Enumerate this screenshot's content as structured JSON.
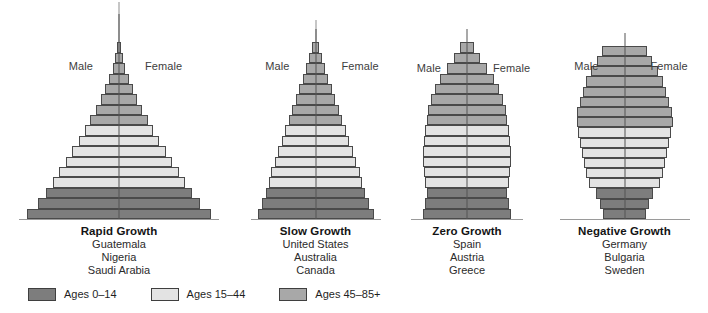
{
  "figure": {
    "type": "population-pyramid-set",
    "background": "#ffffff"
  },
  "colors": {
    "age_0_14": "#7d7d7d",
    "age_15_44": "#e3e3e3",
    "age_45_85plus": "#a8a8a8",
    "outline": "#4a4a4a",
    "centerline": "#555555",
    "baseline": "#9a9a9a",
    "text": "#1a1a1a"
  },
  "legend": {
    "items": [
      {
        "label": "Ages 0–14",
        "color_key": "age_0_14",
        "color": "#7d7d7d"
      },
      {
        "label": "Ages 15–44",
        "color_key": "age_15_44",
        "color": "#e3e3e3"
      },
      {
        "label": "Ages 45–85+",
        "color_key": "age_45_85plus",
        "color": "#a8a8a8"
      }
    ]
  },
  "sex_labels": {
    "male": "Male",
    "female": "Female"
  },
  "chart_data": {
    "type": "bar",
    "title": "",
    "subtitle": "",
    "xlabel": "",
    "ylabel": "",
    "legend_position": "bottom-left",
    "grid": false,
    "age_bands": [
      "Ages 0–14",
      "Ages 15–44",
      "Ages 45–85+"
    ],
    "band_row_counts": {
      "age_0_14": 3,
      "age_15_44": 6,
      "age_45_85plus": 8
    },
    "panels": [
      {
        "title": "Rapid Growth",
        "countries": [
          "Guatemala",
          "Nigeria",
          "Saudi Arabia"
        ],
        "shape": "broad-based triangle",
        "bars_bottom_to_top": [
          100,
          88,
          79,
          72,
          65,
          58,
          51,
          44,
          37,
          31,
          25,
          20,
          15,
          11,
          7,
          4,
          2
        ],
        "bar_bands": [
          "age_0_14",
          "age_0_14",
          "age_0_14",
          "age_15_44",
          "age_15_44",
          "age_15_44",
          "age_15_44",
          "age_15_44",
          "age_15_44",
          "age_45_85plus",
          "age_45_85plus",
          "age_45_85plus",
          "age_45_85plus",
          "age_45_85plus",
          "age_45_85plus",
          "age_45_85plus",
          "age_45_85plus"
        ]
      },
      {
        "title": "Slow Growth",
        "countries": [
          "United States",
          "Australia",
          "Canada"
        ],
        "shape": "narrow triangle",
        "bars_bottom_to_top": [
          100,
          93,
          86,
          81,
          76,
          70,
          64,
          58,
          52,
          46,
          40,
          34,
          28,
          22,
          16,
          11,
          6
        ],
        "bar_bands": [
          "age_0_14",
          "age_0_14",
          "age_0_14",
          "age_15_44",
          "age_15_44",
          "age_15_44",
          "age_15_44",
          "age_15_44",
          "age_15_44",
          "age_45_85plus",
          "age_45_85plus",
          "age_45_85plus",
          "age_45_85plus",
          "age_45_85plus",
          "age_45_85plus",
          "age_45_85plus",
          "age_45_85plus"
        ]
      },
      {
        "title": "Zero Growth",
        "countries": [
          "Spain",
          "Austria",
          "Greece"
        ],
        "shape": "column with tapered top",
        "bars_bottom_to_top": [
          100,
          96,
          92,
          95,
          97,
          99,
          100,
          98,
          95,
          92,
          88,
          82,
          73,
          61,
          46,
          30,
          16
        ],
        "bar_bands": [
          "age_0_14",
          "age_0_14",
          "age_0_14",
          "age_15_44",
          "age_15_44",
          "age_15_44",
          "age_15_44",
          "age_15_44",
          "age_15_44",
          "age_45_85plus",
          "age_45_85plus",
          "age_45_85plus",
          "age_45_85plus",
          "age_45_85plus",
          "age_45_85plus",
          "age_45_85plus",
          "age_45_85plus"
        ]
      },
      {
        "title": "Negative Growth",
        "countries": [
          "Germany",
          "Bulgaria",
          "Sweden"
        ],
        "shape": "narrow base, bulging middle",
        "bars_bottom_to_top": [
          44,
          52,
          60,
          74,
          80,
          84,
          88,
          92,
          96,
          100,
          98,
          93,
          87,
          80,
          70,
          58,
          46
        ],
        "bar_bands": [
          "age_0_14",
          "age_0_14",
          "age_0_14",
          "age_15_44",
          "age_15_44",
          "age_15_44",
          "age_15_44",
          "age_15_44",
          "age_15_44",
          "age_45_85plus",
          "age_45_85plus",
          "age_45_85plus",
          "age_45_85plus",
          "age_45_85plus",
          "age_45_85plus",
          "age_45_85plus",
          "age_45_85plus"
        ]
      }
    ]
  }
}
